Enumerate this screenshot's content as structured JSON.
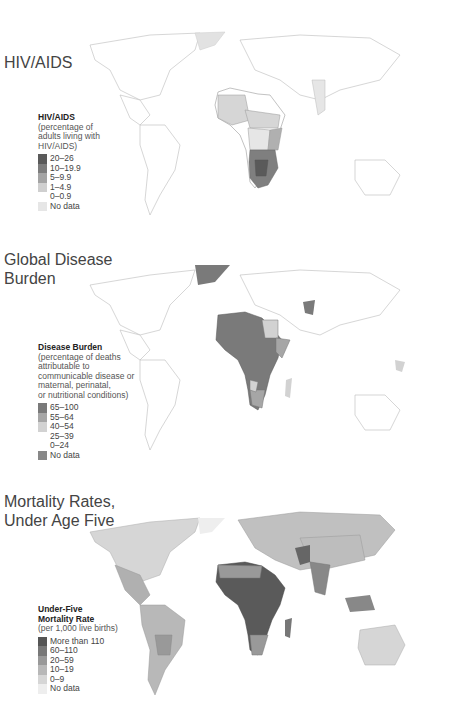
{
  "maps": [
    {
      "title": "HIV/AIDS",
      "legend": {
        "title": "HIV/AIDS",
        "subtitle_lines": [
          "(percentage of",
          "adults living with",
          "HIV/AIDS)"
        ],
        "items": [
          {
            "label": "20–26",
            "color": "#5a5a5a"
          },
          {
            "label": "10–19.9",
            "color": "#7d7d7d"
          },
          {
            "label": "5–9.9",
            "color": "#a4a4a4"
          },
          {
            "label": "1–4.9",
            "color": "#cfcfcf"
          },
          {
            "label": "0–0.9",
            "color": "#ffffff"
          },
          {
            "label": "No data",
            "color": "#e6e6e6"
          }
        ]
      }
    },
    {
      "title_lines": [
        "Global Disease",
        "Burden"
      ],
      "legend": {
        "title": "Disease Burden",
        "subtitle_lines": [
          "(percentage of deaths",
          "attributable to",
          "communicable disease or",
          "maternal, perinatal,",
          "or nutritional conditions)"
        ],
        "items": [
          {
            "label": "65–100",
            "color": "#7a7a7a"
          },
          {
            "label": "55–64",
            "color": "#a6a6a6"
          },
          {
            "label": "40–54",
            "color": "#d2d2d2"
          },
          {
            "label": "25–39",
            "color": "#ffffff"
          },
          {
            "label": "0–24",
            "color": "#ffffff"
          },
          {
            "label": "No data",
            "color": "#888888"
          }
        ]
      }
    },
    {
      "title_lines": [
        "Mortality Rates,",
        "Under Age Five"
      ],
      "legend": {
        "title_lines": [
          "Under-Five",
          "Mortality Rate"
        ],
        "subtitle": "(per 1,000 live births)",
        "items": [
          {
            "label": "More than 110",
            "color": "#555555"
          },
          {
            "label": "60–110",
            "color": "#787878"
          },
          {
            "label": "20–59",
            "color": "#999999"
          },
          {
            "label": "10–19",
            "color": "#b8b8b8"
          },
          {
            "label": "0–9",
            "color": "#d6d6d6"
          },
          {
            "label": "No data",
            "color": "#eeeeee"
          }
        ]
      }
    }
  ]
}
